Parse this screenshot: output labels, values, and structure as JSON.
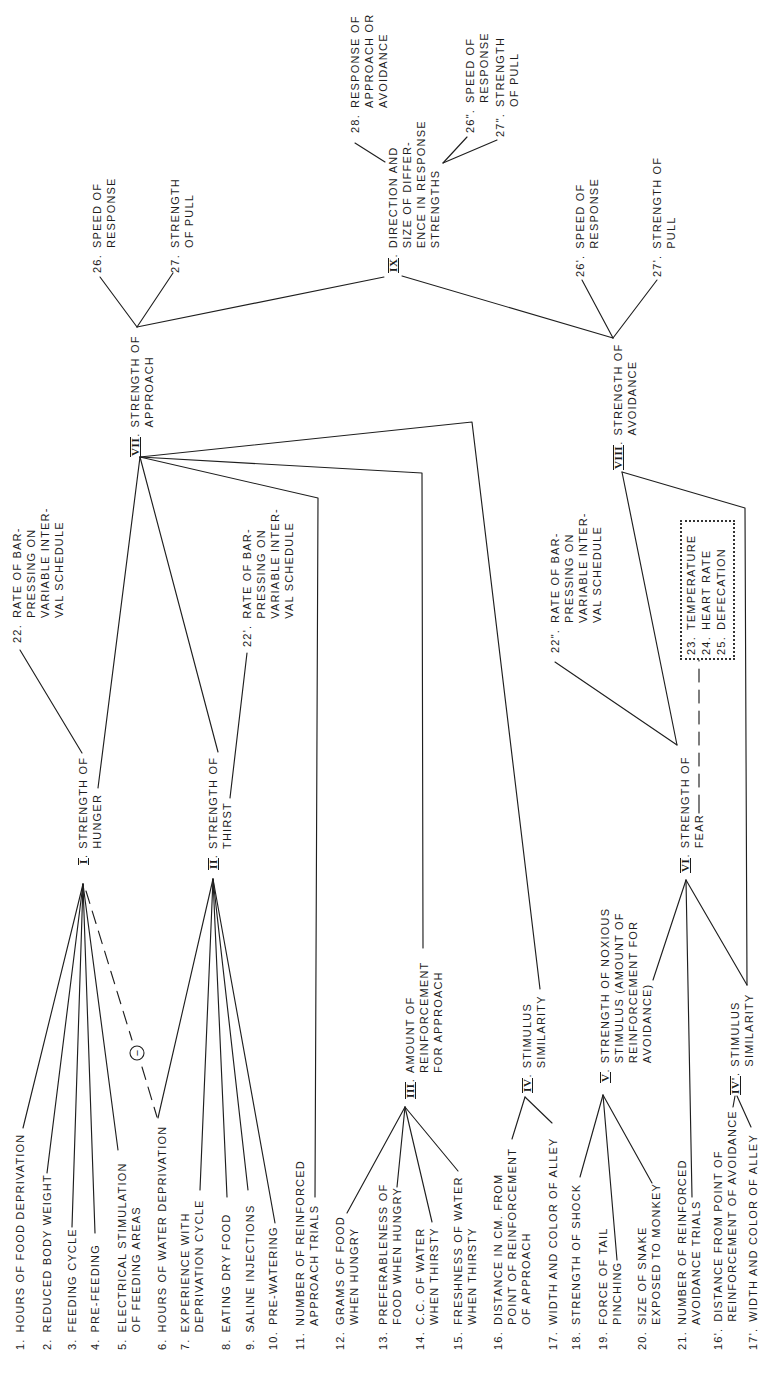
{
  "diagram": {
    "punct": ".",
    "inhibition_symbol": "−",
    "line_color": "#1f1f1f",
    "background": "#ffffff"
  },
  "inputs": [
    {
      "num": "1.",
      "lines": [
        "HOURS OF FOOD DEPRIVATION"
      ]
    },
    {
      "num": "2.",
      "lines": [
        "REDUCED BODY WEIGHT"
      ]
    },
    {
      "num": "3.",
      "lines": [
        "FEEDING CYCLE"
      ]
    },
    {
      "num": "4.",
      "lines": [
        "PRE-FEEDING"
      ]
    },
    {
      "num": "5.",
      "lines": [
        "ELECTRICAL STIMULATION",
        "OF FEEDING AREAS"
      ]
    },
    {
      "num": "6.",
      "lines": [
        "HOURS OF WATER DEPRIVATION"
      ]
    },
    {
      "num": "7.",
      "lines": [
        "EXPERIENCE WITH",
        "DEPRIVATION CYCLE"
      ]
    },
    {
      "num": "8.",
      "lines": [
        "EATING DRY FOOD"
      ]
    },
    {
      "num": "9.",
      "lines": [
        "SALINE INJECTIONS"
      ]
    },
    {
      "num": "10.",
      "lines": [
        "PRE-WATERING"
      ]
    },
    {
      "num": "11.",
      "lines": [
        "NUMBER OF REINFORCED",
        "APPROACH TRIALS"
      ]
    },
    {
      "num": "12.",
      "lines": [
        "GRAMS OF FOOD",
        "WHEN HUNGRY"
      ]
    },
    {
      "num": "13.",
      "lines": [
        "PREFERABLENESS OF",
        "FOOD WHEN HUNGRY"
      ]
    },
    {
      "num": "14.",
      "lines": [
        "C.C. OF WATER",
        "WHEN THIRSTY"
      ]
    },
    {
      "num": "15.",
      "lines": [
        "FRESHNESS OF WATER",
        "WHEN THIRSTY"
      ]
    },
    {
      "num": "16.",
      "lines": [
        "DISTANCE IN CM. FROM",
        "POINT OF REINFORCEMENT",
        "OF APPROACH"
      ]
    },
    {
      "num": "17.",
      "lines": [
        "WIDTH AND COLOR OF ALLEY"
      ]
    },
    {
      "num": "18.",
      "lines": [
        "STRENGTH OF SHOCK"
      ]
    },
    {
      "num": "19.",
      "lines": [
        "FORCE OF TAIL",
        "PINCHING"
      ]
    },
    {
      "num": "20.",
      "lines": [
        "SIZE OF SNAKE",
        "EXPOSED TO MONKEY"
      ]
    },
    {
      "num": "21.",
      "lines": [
        "NUMBER OF REINFORCED",
        "AVOIDANCE TRIALS"
      ]
    },
    {
      "num": "16'.",
      "lines": [
        "DISTANCE FROM POINT OF",
        "REINFORCEMENT OF AVOIDANCE"
      ]
    },
    {
      "num": "17'.",
      "lines": [
        "WIDTH AND COLOR OF ALLEY"
      ]
    }
  ],
  "nodes": [
    {
      "numeral": "I",
      "lines": [
        "STRENGTH OF",
        "HUNGER"
      ]
    },
    {
      "numeral": "II",
      "lines": [
        "STRENGTH OF",
        "THIRST"
      ]
    },
    {
      "numeral": "III",
      "lines": [
        "AMOUNT OF",
        "REINFORCEMENT",
        "FOR APPROACH"
      ]
    },
    {
      "numeral": "IV",
      "lines": [
        "STIMULUS",
        "SIMILARITY"
      ]
    },
    {
      "numeral": "V",
      "lines": [
        "STRENGTH OF NOXIOUS",
        "STIMULUS (AMOUNT OF",
        "REINFORCEMENT FOR",
        "AVOIDANCE)"
      ]
    },
    {
      "numeral": "IV'",
      "lines": [
        "STIMULUS",
        "SIMILARITY"
      ]
    },
    {
      "numeral": "VI",
      "lines": [
        "STRENGTH OF",
        "FEAR"
      ]
    },
    {
      "numeral": "VII",
      "lines": [
        "STRENGTH OF",
        "APPROACH"
      ]
    },
    {
      "numeral": "VIII",
      "lines": [
        "STRENGTH OF",
        "AVOIDANCE"
      ]
    },
    {
      "numeral": "IX",
      "lines": [
        "DIRECTION AND",
        "SIZE OF DIFFER-",
        "ENCE IN RESPONSE",
        "STRENGTHS"
      ]
    }
  ],
  "outputs": [
    {
      "num": "22.",
      "lines": [
        "RATE OF BAR-",
        "PRESSING ON",
        "VARIABLE INTER-",
        "VAL SCHEDULE"
      ]
    },
    {
      "num": "22'.",
      "lines": [
        "RATE OF BAR-",
        "PRESSING ON",
        "VARIABLE INTER-",
        "VAL SCHEDULE"
      ]
    },
    {
      "num": "22\".",
      "lines": [
        "RATE OF BAR-",
        "PRESSING ON",
        "VARIABLE INTER-",
        "VAL SCHEDULE"
      ]
    },
    {
      "num": "26.",
      "lines": [
        "SPEED OF",
        "RESPONSE"
      ]
    },
    {
      "num": "27.",
      "lines": [
        "STRENGTH",
        "OF PULL"
      ]
    },
    {
      "num": "28.",
      "lines": [
        "RESPONSE OF",
        "APPROACH OR",
        "AVOIDANCE"
      ]
    },
    {
      "num": "26\".",
      "lines": [
        "SPEED OF",
        "RESPONSE"
      ]
    },
    {
      "num": "27\".",
      "lines": [
        "STRENGTH",
        "OF PULL"
      ]
    },
    {
      "num": "26'.",
      "lines": [
        "SPEED OF",
        "RESPONSE"
      ]
    },
    {
      "num": "27'.",
      "lines": [
        "STRENGTH OF",
        "PULL"
      ]
    }
  ],
  "fear_indicators": [
    {
      "num": "23.",
      "label": "TEMPERATURE"
    },
    {
      "num": "24.",
      "label": "HEART RATE"
    },
    {
      "num": "25.",
      "label": "DEFECATION"
    }
  ]
}
